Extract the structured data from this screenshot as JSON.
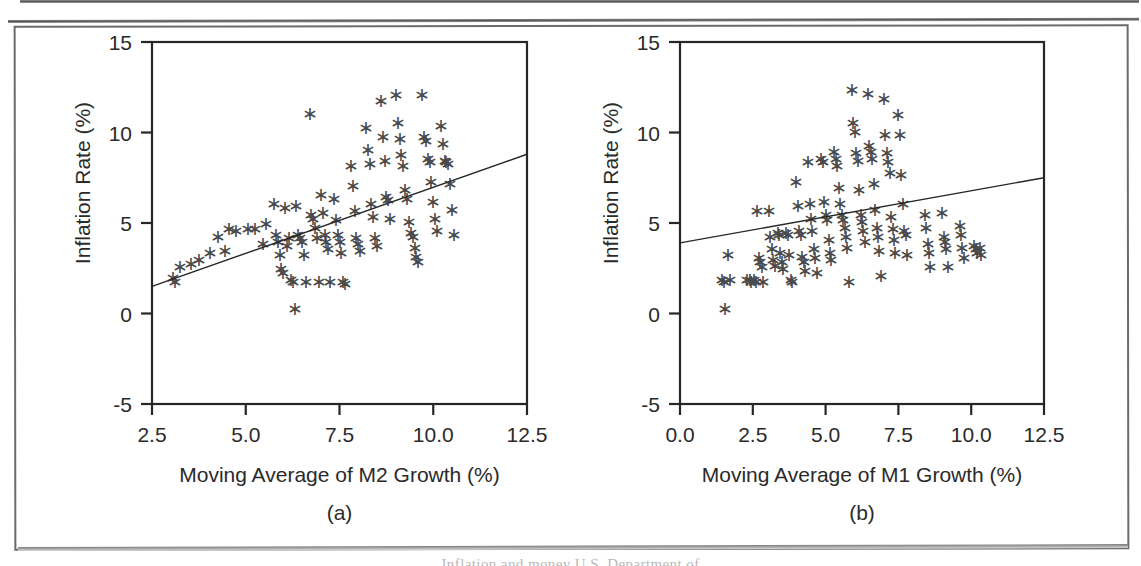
{
  "figure": {
    "type": "scanned-figure-page",
    "caption_sliver": "Inflation and money  U.S. Department of"
  },
  "chart_data": [
    {
      "id": "panel-a",
      "type": "scatter",
      "title": "",
      "panel_letter": "(a)",
      "xlabel": "Moving Average of M2 Growth (%)",
      "ylabel": "Inflation Rate (%)",
      "xlim": [
        2.5,
        12.5
      ],
      "ylim": [
        -5,
        15
      ],
      "xticks": [
        2.5,
        5.0,
        7.5,
        10.0,
        12.5
      ],
      "xtick_labels": [
        "2.5",
        "5.0",
        "7.5",
        "10.0",
        "12.5"
      ],
      "yticks": [
        -5,
        0,
        5,
        10,
        15
      ],
      "ytick_labels": [
        "-5",
        "0",
        "5",
        "10",
        "15"
      ],
      "grid": false,
      "legend": "none",
      "marker": "asterisk",
      "trendline": {
        "x": [
          2.5,
          12.5
        ],
        "y": [
          1.5,
          8.8
        ],
        "label": "regression line"
      },
      "points": [
        [
          3.05,
          2.0
        ],
        [
          3.1,
          1.8
        ],
        [
          3.25,
          2.6
        ],
        [
          3.55,
          2.8
        ],
        [
          3.75,
          3.0
        ],
        [
          4.05,
          3.4
        ],
        [
          4.25,
          4.3
        ],
        [
          4.45,
          3.5
        ],
        [
          4.55,
          4.7
        ],
        [
          4.75,
          4.6
        ],
        [
          5.05,
          4.7
        ],
        [
          5.25,
          4.7
        ],
        [
          5.45,
          3.9
        ],
        [
          5.55,
          5.0
        ],
        [
          5.75,
          6.1
        ],
        [
          5.8,
          4.4
        ],
        [
          5.85,
          4.0
        ],
        [
          5.9,
          3.3
        ],
        [
          5.95,
          2.5
        ],
        [
          6.0,
          2.3
        ],
        [
          6.05,
          5.9
        ],
        [
          6.1,
          3.8
        ],
        [
          6.15,
          4.2
        ],
        [
          6.2,
          1.9
        ],
        [
          6.25,
          1.8
        ],
        [
          6.3,
          0.3
        ],
        [
          6.35,
          6.0
        ],
        [
          6.4,
          4.4
        ],
        [
          6.45,
          4.2
        ],
        [
          6.5,
          4.0
        ],
        [
          6.55,
          3.3
        ],
        [
          6.6,
          1.8
        ],
        [
          6.7,
          11.1
        ],
        [
          6.75,
          5.5
        ],
        [
          6.8,
          5.3
        ],
        [
          6.85,
          4.8
        ],
        [
          6.9,
          4.2
        ],
        [
          6.95,
          1.8
        ],
        [
          7.0,
          6.6
        ],
        [
          7.05,
          5.6
        ],
        [
          7.1,
          4.4
        ],
        [
          7.15,
          4.0
        ],
        [
          7.2,
          3.6
        ],
        [
          7.25,
          1.8
        ],
        [
          7.35,
          6.4
        ],
        [
          7.4,
          5.2
        ],
        [
          7.45,
          4.4
        ],
        [
          7.5,
          4.0
        ],
        [
          7.55,
          3.4
        ],
        [
          7.6,
          1.8
        ],
        [
          7.65,
          1.7
        ],
        [
          7.8,
          8.2
        ],
        [
          7.85,
          7.1
        ],
        [
          7.9,
          5.7
        ],
        [
          7.95,
          4.2
        ],
        [
          8.0,
          3.9
        ],
        [
          8.05,
          3.5
        ],
        [
          8.2,
          10.3
        ],
        [
          8.25,
          9.1
        ],
        [
          8.3,
          8.3
        ],
        [
          8.35,
          6.1
        ],
        [
          8.4,
          5.4
        ],
        [
          8.45,
          4.2
        ],
        [
          8.5,
          3.8
        ],
        [
          8.6,
          11.8
        ],
        [
          8.65,
          9.8
        ],
        [
          8.7,
          8.5
        ],
        [
          8.75,
          6.5
        ],
        [
          8.8,
          6.3
        ],
        [
          8.85,
          5.3
        ],
        [
          9.0,
          12.1
        ],
        [
          9.05,
          10.6
        ],
        [
          9.1,
          9.7
        ],
        [
          9.15,
          8.8
        ],
        [
          9.2,
          8.2
        ],
        [
          9.25,
          6.9
        ],
        [
          9.3,
          6.4
        ],
        [
          9.35,
          5.1
        ],
        [
          9.4,
          4.5
        ],
        [
          9.45,
          4.3
        ],
        [
          9.5,
          3.7
        ],
        [
          9.55,
          3.2
        ],
        [
          9.6,
          2.9
        ],
        [
          9.7,
          12.1
        ],
        [
          9.75,
          9.8
        ],
        [
          9.8,
          9.6
        ],
        [
          9.85,
          8.6
        ],
        [
          9.9,
          8.4
        ],
        [
          9.95,
          7.3
        ],
        [
          10.0,
          6.2
        ],
        [
          10.05,
          5.3
        ],
        [
          10.1,
          4.6
        ],
        [
          10.2,
          10.4
        ],
        [
          10.25,
          9.4
        ],
        [
          10.3,
          8.5
        ],
        [
          10.35,
          8.4
        ],
        [
          10.4,
          8.3
        ],
        [
          10.45,
          7.2
        ],
        [
          10.5,
          5.8
        ],
        [
          10.55,
          4.4
        ]
      ]
    },
    {
      "id": "panel-b",
      "type": "scatter",
      "title": "",
      "panel_letter": "(b)",
      "xlabel": "Moving Average of M1 Growth (%)",
      "ylabel": "Inflation Rate (%)",
      "xlim": [
        0.0,
        12.5
      ],
      "ylim": [
        -5,
        15
      ],
      "xticks": [
        0.0,
        2.5,
        5.0,
        7.5,
        10.0,
        12.5
      ],
      "xtick_labels": [
        "0.0",
        "2.5",
        "5.0",
        "7.5",
        "10.0",
        "12.5"
      ],
      "yticks": [
        -5,
        0,
        5,
        10,
        15
      ],
      "ytick_labels": [
        "-5",
        "0",
        "5",
        "10",
        "15"
      ],
      "grid": false,
      "legend": "none",
      "marker": "asterisk",
      "trendline": {
        "x": [
          0.0,
          12.5
        ],
        "y": [
          3.9,
          7.5
        ],
        "label": "regression line"
      },
      "points": [
        [
          1.45,
          1.9
        ],
        [
          1.5,
          1.8
        ],
        [
          1.55,
          0.3
        ],
        [
          1.65,
          3.3
        ],
        [
          1.7,
          1.9
        ],
        [
          2.3,
          1.9
        ],
        [
          2.4,
          1.9
        ],
        [
          2.45,
          1.8
        ],
        [
          2.55,
          1.9
        ],
        [
          2.6,
          1.8
        ],
        [
          2.65,
          5.7
        ],
        [
          2.7,
          3.1
        ],
        [
          2.75,
          2.9
        ],
        [
          2.8,
          2.6
        ],
        [
          2.85,
          1.8
        ],
        [
          3.05,
          5.7
        ],
        [
          3.1,
          4.3
        ],
        [
          3.15,
          3.6
        ],
        [
          3.2,
          3.0
        ],
        [
          3.25,
          2.7
        ],
        [
          3.35,
          4.5
        ],
        [
          3.4,
          4.4
        ],
        [
          3.45,
          3.4
        ],
        [
          3.5,
          2.9
        ],
        [
          3.55,
          2.5
        ],
        [
          3.65,
          4.5
        ],
        [
          3.7,
          4.4
        ],
        [
          3.75,
          3.3
        ],
        [
          3.8,
          1.9
        ],
        [
          3.85,
          1.8
        ],
        [
          4.0,
          7.3
        ],
        [
          4.05,
          6.0
        ],
        [
          4.1,
          4.6
        ],
        [
          4.15,
          4.4
        ],
        [
          4.2,
          3.2
        ],
        [
          4.25,
          2.9
        ],
        [
          4.3,
          2.4
        ],
        [
          4.4,
          8.4
        ],
        [
          4.45,
          6.1
        ],
        [
          4.5,
          5.3
        ],
        [
          4.55,
          4.6
        ],
        [
          4.6,
          3.6
        ],
        [
          4.65,
          3.1
        ],
        [
          4.7,
          2.3
        ],
        [
          4.85,
          8.6
        ],
        [
          4.9,
          8.4
        ],
        [
          4.95,
          6.2
        ],
        [
          5.0,
          5.5
        ],
        [
          5.05,
          5.2
        ],
        [
          5.1,
          4.1
        ],
        [
          5.15,
          3.4
        ],
        [
          5.2,
          3.0
        ],
        [
          5.3,
          9.0
        ],
        [
          5.35,
          8.6
        ],
        [
          5.4,
          8.2
        ],
        [
          5.45,
          7.0
        ],
        [
          5.5,
          6.1
        ],
        [
          5.55,
          5.5
        ],
        [
          5.6,
          5.2
        ],
        [
          5.65,
          4.8
        ],
        [
          5.7,
          4.3
        ],
        [
          5.75,
          3.7
        ],
        [
          5.8,
          1.8
        ],
        [
          5.9,
          12.4
        ],
        [
          5.95,
          10.6
        ],
        [
          6.0,
          10.1
        ],
        [
          6.05,
          8.9
        ],
        [
          6.1,
          8.5
        ],
        [
          6.15,
          6.9
        ],
        [
          6.2,
          5.5
        ],
        [
          6.25,
          5.1
        ],
        [
          6.3,
          4.6
        ],
        [
          6.35,
          4.0
        ],
        [
          6.45,
          12.2
        ],
        [
          6.5,
          9.3
        ],
        [
          6.55,
          9.0
        ],
        [
          6.6,
          8.6
        ],
        [
          6.65,
          7.2
        ],
        [
          6.7,
          5.8
        ],
        [
          6.75,
          4.8
        ],
        [
          6.8,
          4.3
        ],
        [
          6.85,
          3.5
        ],
        [
          6.9,
          2.1
        ],
        [
          7.0,
          11.9
        ],
        [
          7.05,
          9.9
        ],
        [
          7.1,
          8.9
        ],
        [
          7.15,
          8.4
        ],
        [
          7.2,
          7.8
        ],
        [
          7.25,
          5.4
        ],
        [
          7.3,
          4.7
        ],
        [
          7.35,
          4.1
        ],
        [
          7.4,
          3.4
        ],
        [
          7.5,
          11.0
        ],
        [
          7.55,
          9.9
        ],
        [
          7.6,
          7.7
        ],
        [
          7.65,
          6.1
        ],
        [
          7.7,
          4.6
        ],
        [
          7.75,
          4.4
        ],
        [
          7.8,
          3.3
        ],
        [
          8.4,
          5.5
        ],
        [
          8.45,
          4.8
        ],
        [
          8.5,
          3.9
        ],
        [
          8.55,
          3.4
        ],
        [
          8.6,
          2.6
        ],
        [
          9.0,
          5.6
        ],
        [
          9.05,
          4.3
        ],
        [
          9.1,
          4.0
        ],
        [
          9.15,
          3.6
        ],
        [
          9.2,
          2.6
        ],
        [
          9.6,
          4.9
        ],
        [
          9.65,
          4.4
        ],
        [
          9.7,
          3.7
        ],
        [
          9.75,
          3.1
        ],
        [
          10.1,
          3.8
        ],
        [
          10.15,
          3.6
        ],
        [
          10.2,
          3.4
        ],
        [
          10.3,
          3.7
        ],
        [
          10.35,
          3.3
        ]
      ]
    }
  ]
}
